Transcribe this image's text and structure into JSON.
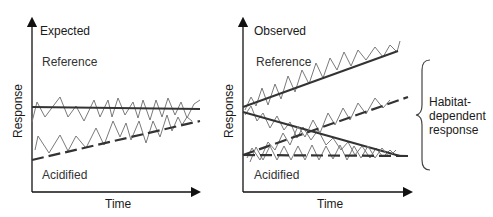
{
  "panels": [
    {
      "title": "Expected",
      "reference_label": "Reference",
      "acidified_label": "Acidified",
      "x_axis_label": "Time",
      "y_axis_label": "Response"
    },
    {
      "title": "Observed",
      "reference_label": "Reference",
      "acidified_label": "Acidified",
      "x_axis_label": "Time",
      "y_axis_label": "Response",
      "annotation": [
        "Habitat-",
        "dependent",
        "response"
      ]
    }
  ],
  "styles": {
    "axis_color": "#111111",
    "trend_color": "#333333",
    "zigzag_color": "#7a7a7a"
  }
}
